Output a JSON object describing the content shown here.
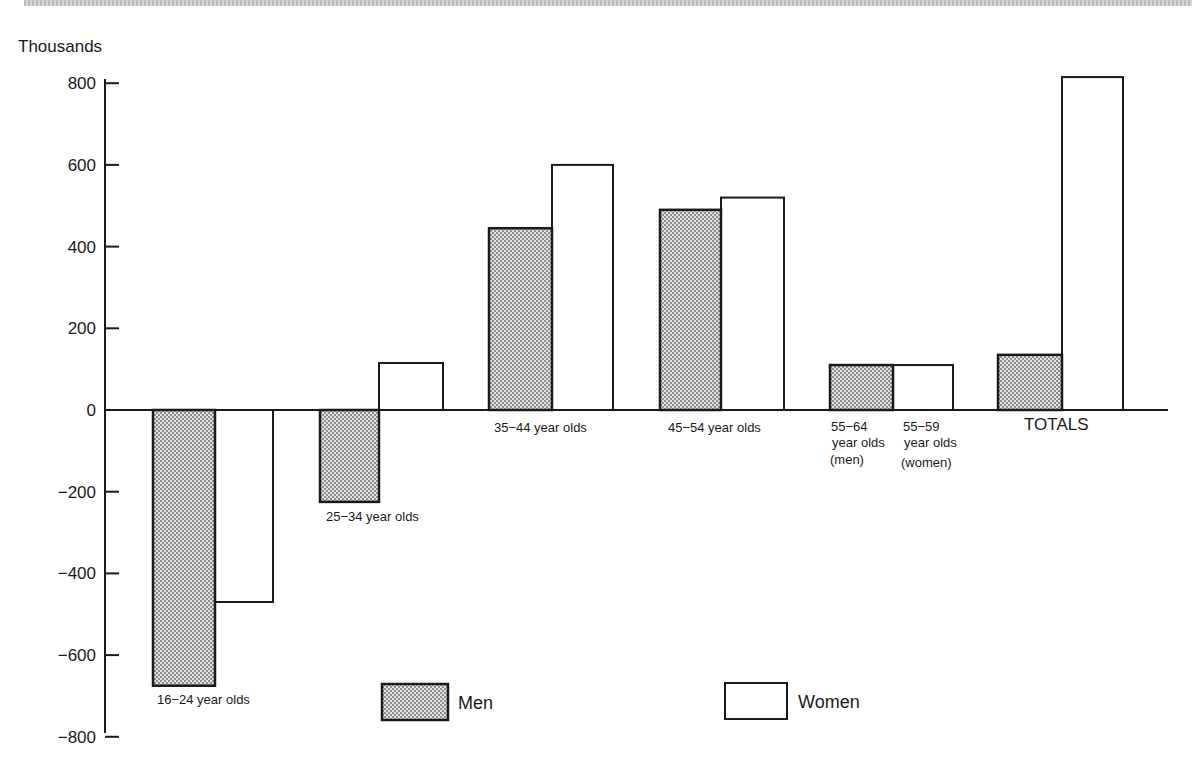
{
  "chart_data": {
    "type": "bar",
    "title": "",
    "ylabel": "Thousands",
    "xlabel": "",
    "ylim": [
      -800,
      800
    ],
    "yticks": [
      800,
      600,
      400,
      200,
      0,
      -200,
      -400,
      -600,
      -800
    ],
    "ytick_labels": [
      "800",
      "600",
      "400",
      "200",
      "0",
      "−200",
      "−400",
      "−600",
      "−800"
    ],
    "grid": false,
    "legend_position": "bottom",
    "categories": [
      "16−24 year olds",
      "25−34 year olds",
      "35−44 year olds",
      "45−54 year olds",
      "55−64 year olds (men) / 55−59 year olds (women)",
      "TOTALS"
    ],
    "series": [
      {
        "name": "Men",
        "pattern": "stippled-gray",
        "values": [
          -675,
          -225,
          445,
          490,
          110,
          135
        ]
      },
      {
        "name": "Women",
        "pattern": "white",
        "values": [
          -470,
          115,
          600,
          520,
          110,
          815
        ]
      }
    ],
    "annotations": [
      "16−24 year olds",
      "25−34 year olds",
      "35−44 year olds",
      "45−54 year olds",
      "55−64 year olds (men)",
      "55−59 year olds (women)",
      "TOTALS"
    ]
  },
  "axis": {
    "unit_label": "Thousands",
    "ticks": [
      {
        "label": "800",
        "value": 800
      },
      {
        "label": "600",
        "value": 600
      },
      {
        "label": "400",
        "value": 400
      },
      {
        "label": "200",
        "value": 200
      },
      {
        "label": "0",
        "value": 0
      },
      {
        "label": "−200",
        "value": -200
      },
      {
        "label": "−400",
        "value": -400
      },
      {
        "label": "−600",
        "value": -600
      },
      {
        "label": "−800",
        "value": -800
      }
    ]
  },
  "labels": {
    "g1": "16−24 year olds",
    "g2": "25−34 year olds",
    "g3": "35−44 year olds",
    "g4": "45−54 year olds",
    "g5_men_line1": "55−64",
    "g5_men_line2": "year olds",
    "g5_men_line3": "(men)",
    "g5_women_line1": "55−59",
    "g5_women_line2": "year olds",
    "g5_women_line3": "(women)",
    "totals": "TOTALS"
  },
  "legend": {
    "men": "Men",
    "women": "Women"
  },
  "colors": {
    "ink": "#1a1a1a",
    "men_fill_dark": "#9a9a9a",
    "men_fill_light": "#e0e0e0",
    "women_fill": "#ffffff"
  }
}
